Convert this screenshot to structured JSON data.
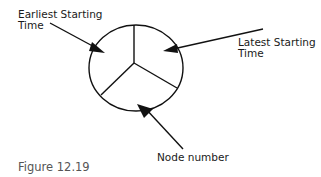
{
  "diagram": {
    "labels": {
      "earliest_line1": "Earliest Starting",
      "earliest_line2": "Time",
      "latest_line1": "Latest Starting",
      "latest_line2": "Time",
      "node": "Node number"
    },
    "caption": "Figure 12.19"
  }
}
